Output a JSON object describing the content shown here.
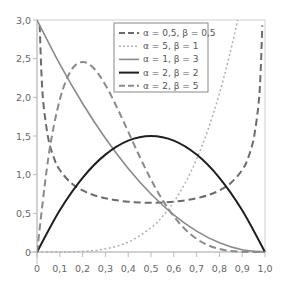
{
  "chart_data": {
    "type": "line",
    "title": "",
    "xlabel": "",
    "ylabel": "",
    "xlim": [
      0,
      1
    ],
    "ylim": [
      0,
      3
    ],
    "grid": false,
    "legend_position": "upper center",
    "x_ticks": [
      "0",
      "0,1",
      "0,2",
      "0,3",
      "0,4",
      "0,5",
      "0,6",
      "0,7",
      "0,8",
      "0,9",
      "1,0"
    ],
    "y_ticks": [
      "0",
      "0,5",
      "1,0",
      "1,5",
      "2,0",
      "2,5",
      "3,0"
    ],
    "series": [
      {
        "name": "α = 0,5, β = 0,5",
        "style": "dashed",
        "color": "#6b6b6b",
        "width": 2,
        "x": [
          0.012,
          0.02,
          0.03,
          0.05,
          0.075,
          0.1,
          0.15,
          0.2,
          0.25,
          0.3,
          0.35,
          0.4,
          0.45,
          0.5,
          0.55,
          0.6,
          0.65,
          0.7,
          0.75,
          0.8,
          0.85,
          0.9,
          0.925,
          0.95,
          0.97,
          0.98,
          0.988
        ],
        "values": [
          2.93,
          2.27,
          1.87,
          1.46,
          1.21,
          1.06,
          0.891,
          0.796,
          0.735,
          0.695,
          0.668,
          0.65,
          0.64,
          0.637,
          0.64,
          0.65,
          0.668,
          0.695,
          0.735,
          0.796,
          0.891,
          1.06,
          1.21,
          1.46,
          1.87,
          2.27,
          2.93
        ]
      },
      {
        "name": "α = 5, β = 1",
        "style": "dotted",
        "color": "#b0b0b0",
        "width": 1.5,
        "x": [
          0,
          0.1,
          0.2,
          0.3,
          0.4,
          0.5,
          0.55,
          0.6,
          0.65,
          0.7,
          0.75,
          0.8,
          0.85,
          0.88
        ],
        "values": [
          0,
          0.0005,
          0.008,
          0.0405,
          0.128,
          0.3125,
          0.4575,
          0.648,
          0.8925,
          1.2005,
          1.582,
          2.048,
          2.61,
          2.998
        ]
      },
      {
        "name": "α = 1, β = 3",
        "style": "solid",
        "color": "#8a8a8a",
        "width": 1.6,
        "x": [
          0,
          0.1,
          0.2,
          0.3,
          0.4,
          0.5,
          0.6,
          0.7,
          0.8,
          0.9,
          1.0
        ],
        "values": [
          3.0,
          2.43,
          1.92,
          1.47,
          1.08,
          0.75,
          0.48,
          0.27,
          0.12,
          0.03,
          0
        ]
      },
      {
        "name": "α = 2, β = 2",
        "style": "solid",
        "color": "#1e1e1e",
        "width": 2,
        "x": [
          0,
          0.1,
          0.2,
          0.3,
          0.4,
          0.5,
          0.6,
          0.7,
          0.8,
          0.9,
          1.0
        ],
        "values": [
          0,
          0.54,
          0.96,
          1.26,
          1.44,
          1.5,
          1.44,
          1.26,
          0.96,
          0.54,
          0
        ]
      },
      {
        "name": "α = 2, β = 5",
        "style": "dashed",
        "color": "#8a8a8a",
        "width": 2,
        "x": [
          0,
          0.05,
          0.1,
          0.15,
          0.2,
          0.25,
          0.3,
          0.35,
          0.4,
          0.45,
          0.5,
          0.55,
          0.6,
          0.65,
          0.7,
          0.75,
          0.8,
          0.85,
          0.9,
          0.95,
          1.0
        ],
        "values": [
          0,
          1.222,
          1.968,
          2.349,
          2.458,
          2.373,
          2.161,
          1.874,
          1.555,
          1.235,
          0.9375,
          0.676,
          0.4608,
          0.2926,
          0.1701,
          0.0879,
          0.0384,
          0.0129,
          0.0027,
          0.0002,
          0
        ]
      }
    ]
  }
}
